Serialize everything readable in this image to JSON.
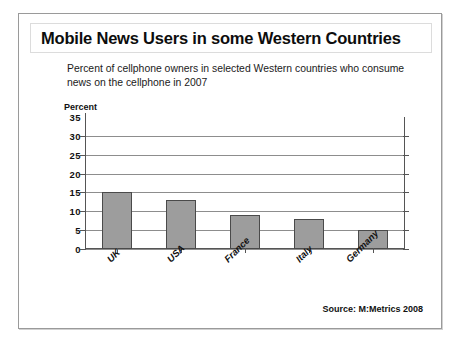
{
  "slide": {
    "title": "Mobile News Users in some Western Countries",
    "subtitle": "Percent of cellphone owners in selected Western countries who consume news on the cellphone in 2007",
    "source": "Source: M:Metrics 2008"
  },
  "colors": {
    "bar_fill": "#9d9d9d",
    "bar_border": "#4a4a4a",
    "gridline": "#8d8d8d",
    "axis": "#555555",
    "text": "#111111",
    "frame": "#9a9a9a"
  },
  "chart_data": {
    "type": "bar",
    "title": "Mobile News Users in some Western Countries",
    "subtitle": "Percent of cellphone owners in selected Western countries who consume news on the cellphone in 2007",
    "categories": [
      "UK",
      "USA",
      "France",
      "Italy",
      "Germany"
    ],
    "values": [
      15,
      13,
      9,
      8,
      5
    ],
    "xlabel": "",
    "ylabel": "Percent",
    "ylim": [
      0,
      35
    ],
    "yticks": [
      0,
      5,
      10,
      15,
      20,
      25,
      30,
      35
    ],
    "ytick_labels": [
      "0",
      "5",
      "10",
      "15",
      "20",
      "25",
      "30",
      "35"
    ],
    "grid": true,
    "gridlines_at": [
      0,
      5,
      10,
      15,
      20,
      25,
      30
    ],
    "legend": "none",
    "source": "Source: M:Metrics 2008"
  }
}
